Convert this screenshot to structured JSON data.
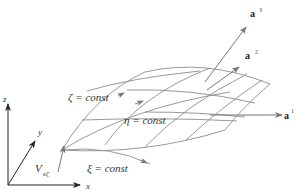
{
  "diagram": {
    "axes": {
      "x": "x",
      "y": "y",
      "z": "z"
    },
    "curves": {
      "zeta": "ζ = const",
      "eta": "η = const",
      "xi": "ξ = const"
    },
    "vectors": {
      "a1": {
        "base": "a",
        "sup": "1"
      },
      "a2": {
        "base": "a",
        "sup": "2"
      },
      "a3": {
        "base": "a",
        "sup": "3"
      }
    },
    "velocity": {
      "base": "V",
      "sub": "eζ"
    },
    "colors": {
      "surface": "#8c8c8c",
      "axes": "#222222",
      "vector": "#777777"
    }
  }
}
